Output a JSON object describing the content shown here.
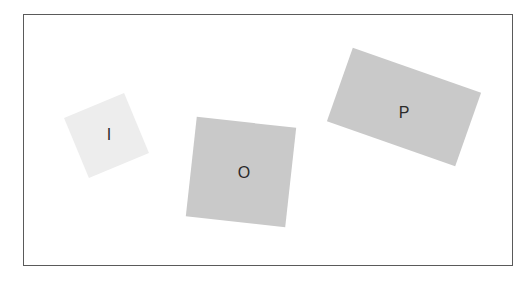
{
  "canvas": {
    "width": 531,
    "height": 282,
    "background": "#ffffff"
  },
  "frame": {
    "left": 23,
    "top": 14,
    "width": 488,
    "height": 250,
    "border_color": "#5a5a5a"
  },
  "cards": [
    {
      "label": "I",
      "center_x": 106,
      "center_y": 135,
      "width": 65,
      "height": 65,
      "rotation_deg": -22.5,
      "fill": "#ededed",
      "label_x": 109,
      "label_y": 135
    },
    {
      "label": "O",
      "center_x": 241,
      "center_y": 172,
      "width": 100,
      "height": 100,
      "rotation_deg": 6.3,
      "fill": "#c9c9c9",
      "label_x": 244,
      "label_y": 173
    },
    {
      "label": "P",
      "center_x": 404,
      "center_y": 107,
      "width": 136,
      "height": 78,
      "rotation_deg": 19.4,
      "fill": "#c9c9c9",
      "label_x": 404,
      "label_y": 113
    }
  ]
}
